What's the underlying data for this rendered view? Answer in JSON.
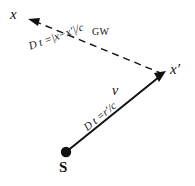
{
  "figure": {
    "background_color": "#ffffff",
    "ink_color": "#111111",
    "nodes": {
      "observer_x": "x",
      "observer_x_prime": "x′",
      "source": "S"
    },
    "edges": {
      "gravitational_wave": {
        "label": "GW",
        "style": "dashed",
        "delay_formula": "D t =|x−x′|/c"
      },
      "source_propagation": {
        "label": "v",
        "style": "solid",
        "delay_formula": "D t =r′/c"
      }
    }
  }
}
